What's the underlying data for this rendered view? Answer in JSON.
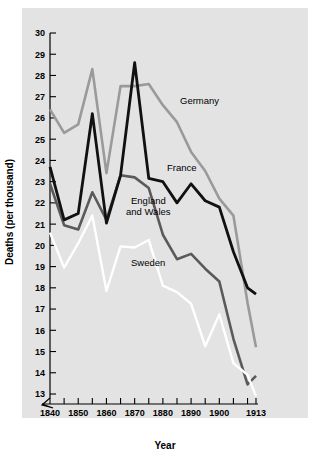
{
  "figure": {
    "background_color": "#ffffff",
    "panel_color": "#e3e3e3"
  },
  "axis": {
    "x_title": "Year",
    "y_title": "Deaths (per thousand)",
    "y_ticks": [
      "30",
      "29",
      "28",
      "27",
      "26",
      "25",
      "24",
      "23",
      "22",
      "21",
      "20",
      "19",
      "18",
      "17",
      "16",
      "15",
      "14",
      "13"
    ],
    "x_ticks": [
      "1840",
      "1850",
      "1860",
      "1870",
      "1880",
      "1890",
      "1900",
      "1913"
    ],
    "x_minor_years": [
      1845,
      1855,
      1865,
      1875,
      1885,
      1895,
      1905,
      1910
    ],
    "axis_break": true
  },
  "labels": {
    "germany": "Germany",
    "france": "France",
    "england_line1": "England",
    "england_line2": "and Wales",
    "sweden": "Sweden"
  },
  "chart_data": {
    "type": "line",
    "title": "",
    "xlabel": "Year",
    "ylabel": "Deaths (per thousand)",
    "xlim": [
      1840,
      1913
    ],
    "ylim": [
      13,
      30
    ],
    "grid": false,
    "legend_position": "inline-annotations",
    "axis_break_below": 13,
    "series": [
      {
        "name": "Germany",
        "color": "#9a9a9a",
        "x": [
          1840,
          1845,
          1850,
          1855,
          1860,
          1865,
          1870,
          1875,
          1880,
          1885,
          1890,
          1895,
          1900,
          1905,
          1910,
          1913
        ],
        "values": [
          26.4,
          25.3,
          25.7,
          28.3,
          23.4,
          27.5,
          27.5,
          27.6,
          26.6,
          25.8,
          24.4,
          23.5,
          22.2,
          21.4,
          17.3,
          15.2
        ]
      },
      {
        "name": "France",
        "color": "#111111",
        "x": [
          1840,
          1845,
          1850,
          1855,
          1860,
          1865,
          1870,
          1875,
          1880,
          1885,
          1890,
          1895,
          1900,
          1905,
          1910,
          1913
        ],
        "values": [
          23.7,
          21.2,
          21.5,
          26.2,
          21.05,
          23.3,
          28.6,
          23.15,
          23.0,
          22.0,
          22.9,
          22.1,
          21.8,
          19.7,
          18.0,
          17.7
        ]
      },
      {
        "name": "England and Wales",
        "color": "#5a5a5a",
        "x": [
          1840,
          1845,
          1850,
          1855,
          1860,
          1865,
          1870,
          1875,
          1880,
          1885,
          1890,
          1895,
          1900,
          1905,
          1910,
          1913
        ],
        "values": [
          22.9,
          20.95,
          20.75,
          22.5,
          21.2,
          23.3,
          23.2,
          22.7,
          20.5,
          19.35,
          19.6,
          18.9,
          18.3,
          15.6,
          13.45,
          13.85
        ]
      },
      {
        "name": "Sweden",
        "color": "#ffffff",
        "x": [
          1840,
          1845,
          1850,
          1855,
          1860,
          1865,
          1870,
          1875,
          1880,
          1885,
          1890,
          1895,
          1900,
          1905,
          1910,
          1913
        ],
        "values": [
          20.6,
          18.95,
          20.1,
          21.4,
          17.85,
          19.95,
          19.9,
          20.25,
          18.1,
          17.8,
          17.25,
          15.25,
          16.75,
          14.45,
          13.9,
          12.9
        ]
      }
    ]
  }
}
